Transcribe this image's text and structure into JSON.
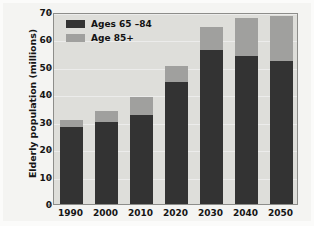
{
  "chart_data": {
    "type": "bar",
    "subtype": "stacked-vertical",
    "title": "",
    "xlabel": "",
    "ylabel": "Elderly population (millions)",
    "categories": [
      "1990",
      "2000",
      "2010",
      "2020",
      "2030",
      "2040",
      "2050"
    ],
    "series": [
      {
        "name": "Ages 65 –84",
        "color": "#333333",
        "values": [
          28,
          30,
          32.5,
          44.5,
          56,
          54,
          52
        ]
      },
      {
        "name": "Age 85+",
        "color": "#a0a09e",
        "values": [
          2.5,
          4,
          6.5,
          6,
          8.5,
          14,
          16.5
        ]
      }
    ],
    "totals": [
      30.5,
      34,
      39,
      50.5,
      64.5,
      68,
      68.5
    ],
    "ylim": [
      0,
      70
    ],
    "yticks": [
      0,
      10,
      20,
      30,
      40,
      50,
      60,
      70
    ],
    "ytick_labels": [
      "0",
      "10",
      "20",
      "30",
      "40",
      "50",
      "60",
      "70"
    ],
    "grid": true,
    "legend_position": "top-left",
    "plot_background": "#dededa",
    "figure_background": "#f4f4f2"
  },
  "legend": {
    "items": [
      {
        "label": "Ages 65 –84",
        "swatch": "dark"
      },
      {
        "label": "Age 85+",
        "swatch": "light"
      }
    ]
  }
}
